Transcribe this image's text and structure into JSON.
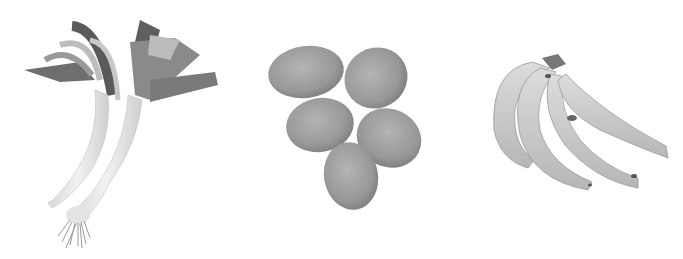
{
  "image": {
    "description": "Grayscale photo of three food items on a white background",
    "background_color": "#ffffff",
    "items": [
      {
        "name": "leeks",
        "count": 2
      },
      {
        "name": "eggs",
        "count": 5
      },
      {
        "name": "bananas",
        "count": 5
      }
    ]
  }
}
